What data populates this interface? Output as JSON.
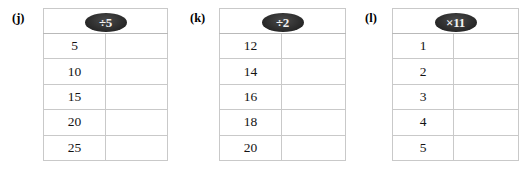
{
  "page": {
    "background_color": "#ffffff",
    "border_color": "#c9c9c9",
    "oval_color": "#2b2b2b",
    "oval_text_color": "#f2f2f2",
    "text_color": "#131313"
  },
  "tables": [
    {
      "label": "(j)",
      "operation": "÷5",
      "header_blank": "",
      "rows": [
        {
          "input": "5",
          "output": ""
        },
        {
          "input": "10",
          "output": ""
        },
        {
          "input": "15",
          "output": ""
        },
        {
          "input": "20",
          "output": ""
        },
        {
          "input": "25",
          "output": ""
        }
      ]
    },
    {
      "label": "(k)",
      "operation": "÷2",
      "header_blank": "",
      "rows": [
        {
          "input": "12",
          "output": ""
        },
        {
          "input": "14",
          "output": ""
        },
        {
          "input": "16",
          "output": ""
        },
        {
          "input": "18",
          "output": ""
        },
        {
          "input": "20",
          "output": ""
        }
      ]
    },
    {
      "label": "(l)",
      "operation": "×11",
      "header_blank": "",
      "rows": [
        {
          "input": "1",
          "output": ""
        },
        {
          "input": "2",
          "output": ""
        },
        {
          "input": "3",
          "output": ""
        },
        {
          "input": "4",
          "output": ""
        },
        {
          "input": "5",
          "output": ""
        }
      ]
    }
  ]
}
